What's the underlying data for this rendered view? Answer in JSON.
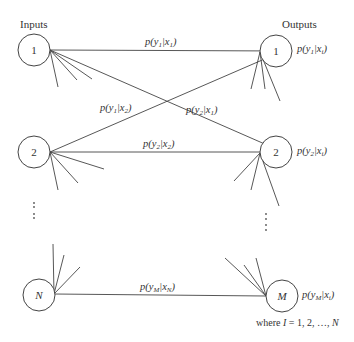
{
  "headers": {
    "inputs": "Inputs",
    "outputs": "Outputs"
  },
  "input_nodes": [
    {
      "label": "1",
      "italic": false
    },
    {
      "label": "2",
      "italic": false
    },
    {
      "label": "N",
      "italic": true
    }
  ],
  "output_nodes": [
    {
      "label": "1",
      "italic": false,
      "prob": {
        "base": "p(y",
        "sub": "1",
        "mid": "|x",
        "sub2": "i",
        "end": ")"
      }
    },
    {
      "label": "2",
      "italic": false,
      "prob": {
        "base": "p(y",
        "sub": "2",
        "mid": "|x",
        "sub2": "i",
        "end": ")"
      }
    },
    {
      "label": "M",
      "italic": true,
      "prob": {
        "base": "p(y",
        "sub": "M",
        "mid": "|x",
        "sub2": "i",
        "end": ")"
      }
    }
  ],
  "edge_labels": {
    "y1_x1": {
      "base": "p(y",
      "sub": "1",
      "mid": "|x",
      "sub2": "1",
      "end": ")"
    },
    "y1_x2": {
      "base": "p(y",
      "sub": "1",
      "mid": "|x",
      "sub2": "2",
      "end": ")"
    },
    "y2_x1": {
      "base": "p(y",
      "sub": "2",
      "mid": "|x",
      "sub2": "1",
      "end": ")"
    },
    "y2_x2": {
      "base": "p(y",
      "sub": "2",
      "mid": "|x",
      "sub2": "2",
      "end": ")"
    },
    "yM_xN": {
      "base": "p(y",
      "sub": "M",
      "mid": "|x",
      "sub2": "N",
      "end": ")"
    }
  },
  "ellipsis": {
    "inputs": "⋮",
    "outputs": "⋮"
  },
  "footnote": {
    "prefix": "where ",
    "var": "I",
    "suffix": " = 1, 2, …, ",
    "last": "N"
  }
}
